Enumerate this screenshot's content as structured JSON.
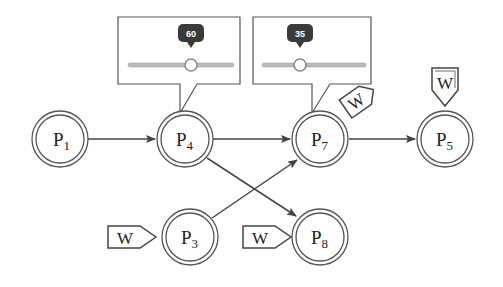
{
  "diagram": {
    "nodes": [
      {
        "id": "P1",
        "label": "P",
        "sub": "1",
        "cx": 60,
        "cy": 139
      },
      {
        "id": "P4",
        "label": "P",
        "sub": "4",
        "cx": 185,
        "cy": 139
      },
      {
        "id": "P7",
        "label": "P",
        "sub": "7",
        "cx": 320,
        "cy": 139
      },
      {
        "id": "P5",
        "label": "P",
        "sub": "5",
        "cx": 445,
        "cy": 139
      },
      {
        "id": "P3",
        "label": "P",
        "sub": "3",
        "cx": 190,
        "cy": 237
      },
      {
        "id": "P8",
        "label": "P",
        "sub": "8",
        "cx": 320,
        "cy": 237
      }
    ],
    "edges": [
      {
        "from": "P1",
        "to": "P4"
      },
      {
        "from": "P4",
        "to": "P7"
      },
      {
        "from": "P7",
        "to": "P5"
      },
      {
        "from": "P4",
        "to": "P8"
      },
      {
        "from": "P3",
        "to": "P7"
      }
    ],
    "sliders": [
      {
        "attached_to": "P4",
        "value": "60",
        "position_pct": 60
      },
      {
        "attached_to": "P7",
        "value": "35",
        "position_pct": 35
      }
    ],
    "badges": [
      {
        "attached_to": "P5",
        "text": "W",
        "style": "above"
      },
      {
        "attached_to": "P7",
        "text": "W",
        "style": "skewed"
      },
      {
        "attached_to": "P3",
        "text": "W",
        "style": "left"
      },
      {
        "attached_to": "P8",
        "text": "W",
        "style": "left"
      }
    ]
  }
}
